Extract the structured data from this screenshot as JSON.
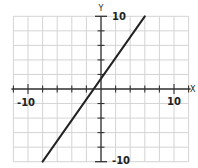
{
  "chart_data": {
    "type": "line",
    "title": "",
    "xlabel": "X",
    "ylabel": "Y",
    "xlim": [
      -12,
      12
    ],
    "ylim": [
      -10,
      10
    ],
    "grid": true,
    "grid_step": 2,
    "tick_labels": {
      "x_neg": "-10",
      "x_pos": "10",
      "y_pos": "10",
      "y_neg": "-10"
    },
    "series": [
      {
        "name": "line",
        "x": [
          -8,
          6
        ],
        "y": [
          -10,
          10
        ],
        "slope": 1.4286,
        "intercept": 1.4286
      }
    ],
    "colors": {
      "grid": "#d4d4d4",
      "axis": "#333333",
      "line": "#222222"
    }
  }
}
